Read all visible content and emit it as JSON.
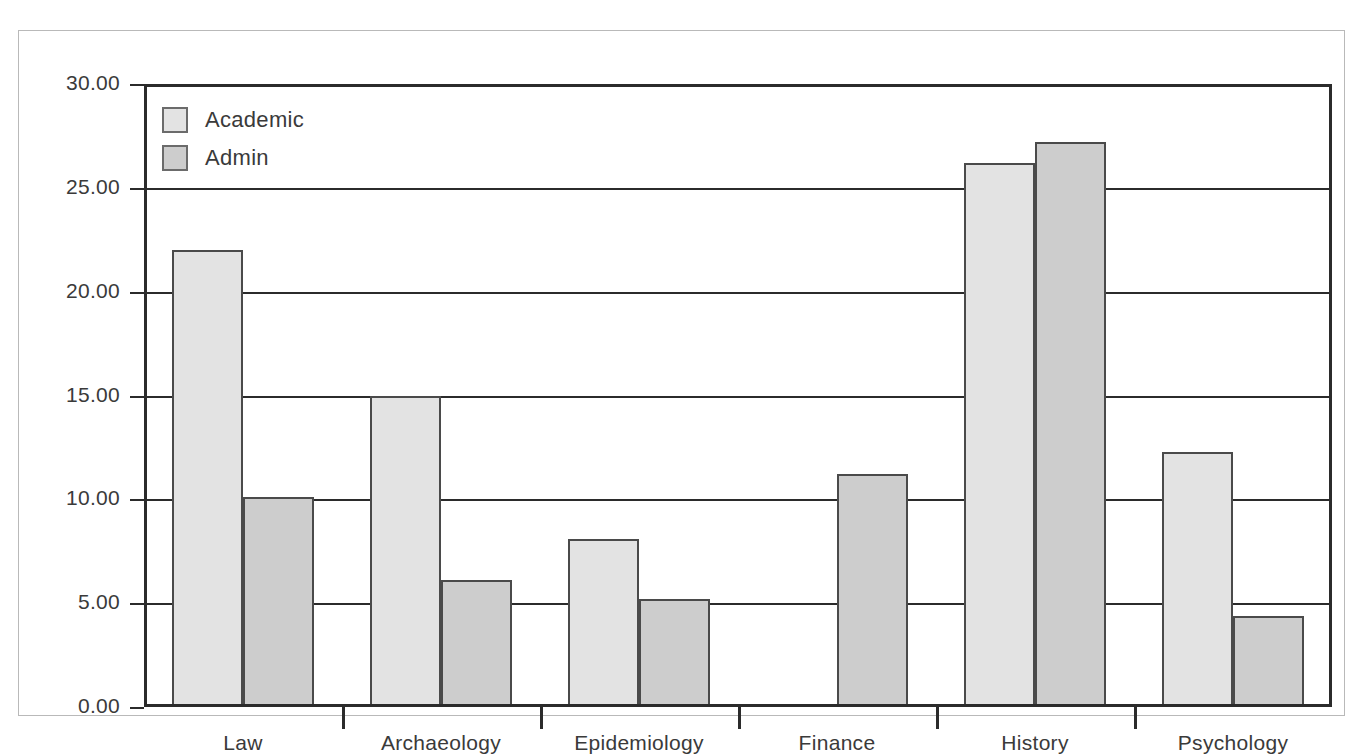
{
  "chart_data": {
    "type": "bar",
    "title": "",
    "subtitle": "",
    "xlabel": "",
    "ylabel": "",
    "categories": [
      "Law",
      "Archaeology",
      "Epidemiology",
      "Finance",
      "History",
      "Psychology"
    ],
    "series": [
      {
        "name": "Academic",
        "color": "#e3e3e3",
        "values": [
          22.0,
          15.0,
          8.1,
          0.0,
          26.2,
          12.3
        ]
      },
      {
        "name": "Admin",
        "color": "#cdcdcd",
        "values": [
          10.1,
          6.1,
          5.2,
          11.2,
          27.2,
          4.4
        ]
      }
    ],
    "ylim": [
      0,
      30
    ],
    "ytick_values": [
      0,
      5,
      10,
      15,
      20,
      25,
      30
    ],
    "ytick_labels": [
      "0.00",
      "5.00",
      "10.00",
      "15.00",
      "20.00",
      "25.00",
      "30.00"
    ],
    "grid": true,
    "grid_axis": "y",
    "legend_position": "upper-left",
    "legend_entries": [
      "Academic",
      "Admin"
    ],
    "annotations": []
  },
  "colors": {
    "axis": "#2b2b2b",
    "bar_outline": "#4a4a4a",
    "frame": "#b9b9b9",
    "text": "#3a3a3a",
    "background": "#ffffff"
  }
}
